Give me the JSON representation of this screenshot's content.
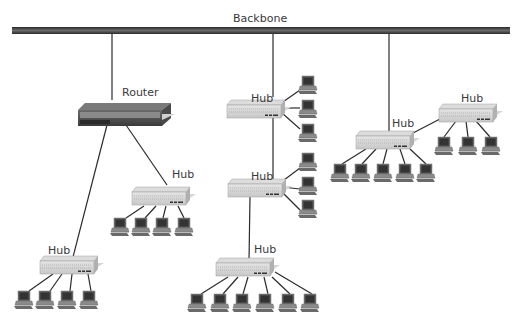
{
  "diagram": {
    "type": "network-topology",
    "backbone": {
      "label": "Backbone"
    },
    "router": {
      "label": "Router"
    },
    "hubs": [
      {
        "id": "hub-router-right",
        "label": "Hub",
        "computers": 4,
        "parent": "router"
      },
      {
        "id": "hub-router-left",
        "label": "Hub",
        "computers": 4,
        "parent": "router"
      },
      {
        "id": "hub-middle-top",
        "label": "Hub",
        "computers": 3,
        "parent": "backbone"
      },
      {
        "id": "hub-middle-mid",
        "label": "Hub",
        "computers": 3,
        "parent": "hub-middle-top"
      },
      {
        "id": "hub-middle-bottom",
        "label": "Hub",
        "computers": 6,
        "parent": "hub-middle-mid"
      },
      {
        "id": "hub-right",
        "label": "Hub",
        "computers": 5,
        "parent": "backbone"
      },
      {
        "id": "hub-far-right",
        "label": "Hub",
        "computers": 3,
        "parent": "hub-right"
      }
    ]
  }
}
